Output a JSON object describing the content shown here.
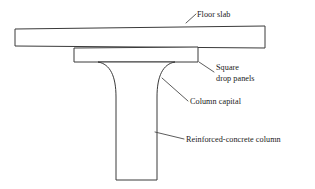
{
  "figure": {
    "canvas": {
      "width": 315,
      "height": 189
    },
    "colors": {
      "background": "#ffffff",
      "outline": "#3a3a3a",
      "leader": "#4a4a4a",
      "text": "#1a1a1a"
    }
  },
  "annotations": [
    {
      "id": "floor-slab",
      "label": "Floor slab",
      "lines": [
        "Floor slab"
      ],
      "text_x": 197,
      "text_y": 17,
      "leader": "M 186 23 L 196 14"
    },
    {
      "id": "square-drop-panels",
      "label": "Square drop panels",
      "lines": [
        "Square",
        "drop panels"
      ],
      "text_x": 216,
      "text_y": 70,
      "leader": "M 199 62 L 214 72"
    },
    {
      "id": "column-capital",
      "label": "Column capital",
      "lines": [
        "Column capital"
      ],
      "text_x": 190,
      "text_y": 104,
      "leader": "M 162 78 L 188 101"
    },
    {
      "id": "reinforced-concrete-column",
      "label": "Reinforced-concrete column",
      "lines": [
        "Reinforced-concrete column"
      ],
      "text_x": 186,
      "text_y": 142,
      "leader": "M 155 132 L 184 139"
    }
  ],
  "shapes": {
    "floor_slab": {
      "name": "Floor slab",
      "path": "M 15 29 L 265 26 L 265 48 L 15 46 Z"
    },
    "drop_panel": {
      "name": "Square drop panels",
      "path": "M 74 48 L 198 47 L 198 62 L 74 62 Z"
    },
    "column_with_capital": {
      "name": "Reinforced-concrete column with capital",
      "path": "M 98 62 C 110 64 116 76 116 97 L 116 180 L 157 180 L 157 97 C 157 76 163 64 175 62 Z"
    }
  }
}
